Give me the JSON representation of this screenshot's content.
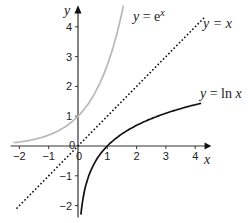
{
  "chart_data": {
    "type": "line",
    "title": "",
    "xlabel": "x",
    "ylabel": "y",
    "xlim": [
      -2.3,
      4.4
    ],
    "ylim": [
      -2.4,
      4.6
    ],
    "grid": false,
    "x_ticks": [
      -2,
      -1,
      0,
      1,
      2,
      3,
      4
    ],
    "y_ticks": [
      -2,
      -1,
      1,
      2,
      3,
      4
    ],
    "origin_label": "0",
    "series": [
      {
        "name": "y = e^x",
        "label_main": "y = e",
        "label_sup": "x",
        "color": "#b8b8b8",
        "style": "solid",
        "x": [
          -2.2,
          -2,
          -1.5,
          -1,
          -0.5,
          0,
          0.5,
          1,
          1.2,
          1.4,
          1.58
        ],
        "values": [
          0.11,
          0.14,
          0.22,
          0.37,
          0.61,
          1,
          1.65,
          2.72,
          3.32,
          4.06,
          4.85
        ]
      },
      {
        "name": "y = x",
        "label_main": "y = x",
        "color": "#111111",
        "style": "dotted",
        "x": [
          -2.1,
          4.3
        ],
        "values": [
          -2.1,
          4.3
        ]
      },
      {
        "name": "y = ln x",
        "label_main": "y = ln x",
        "color": "#111111",
        "style": "solid",
        "x": [
          0.1,
          0.15,
          0.25,
          0.5,
          1,
          1.5,
          2,
          3,
          4.2
        ],
        "values": [
          -2.3,
          -1.9,
          -1.39,
          -0.69,
          0,
          0.41,
          0.69,
          1.1,
          1.44
        ]
      }
    ]
  }
}
